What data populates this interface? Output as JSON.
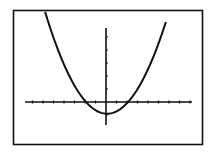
{
  "chart_data": {
    "type": "line",
    "title": "",
    "xlabel": "",
    "ylabel": "",
    "grid": false,
    "legend": null,
    "xlim": [
      -7.8,
      8.2
    ],
    "ylim": [
      -1.8,
      5.7
    ],
    "x_tick_spacing": 1,
    "y_tick_spacing": 1,
    "series": [
      {
        "name": "parabola",
        "equation": "y = 0.2x^2 - 0.9",
        "vertex": [
          0.1,
          -0.9
        ],
        "roots": [
          -2.1,
          2.1
        ],
        "x": [
          -5.8,
          -5,
          -4,
          -3,
          -2.1,
          -1,
          0,
          0.1,
          1,
          2.1,
          3,
          4,
          5,
          5.7
        ],
        "values": [
          5.8,
          4.1,
          2.3,
          0.9,
          0.0,
          -0.7,
          -0.9,
          -0.9,
          -0.7,
          0.0,
          0.9,
          2.3,
          4.1,
          5.6
        ]
      }
    ],
    "colors": {
      "curve": "#111111",
      "axes": "#111111",
      "frame": "#111111",
      "background": "#ffffff"
    }
  }
}
